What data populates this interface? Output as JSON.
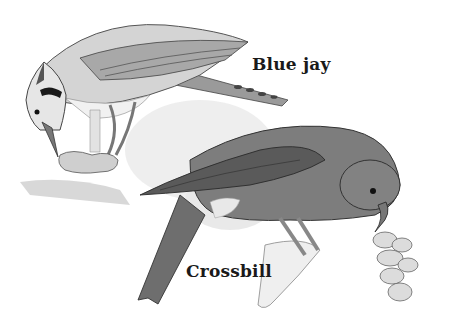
{
  "illustration": {
    "style": "grayscale pencil sketch",
    "birds": [
      {
        "name": "blue-jay",
        "label": "Blue jay"
      },
      {
        "name": "crossbill",
        "label": "Crossbill"
      }
    ]
  },
  "colors": {
    "background": "#ffffff",
    "ink": "#1a1a1a",
    "wash_light": "#e3e3e3",
    "crossbill_body": "#7d7d7d",
    "crossbill_dark": "#555555",
    "jay_body": "#d8d8d8",
    "jay_dark": "#6a6a6a"
  }
}
